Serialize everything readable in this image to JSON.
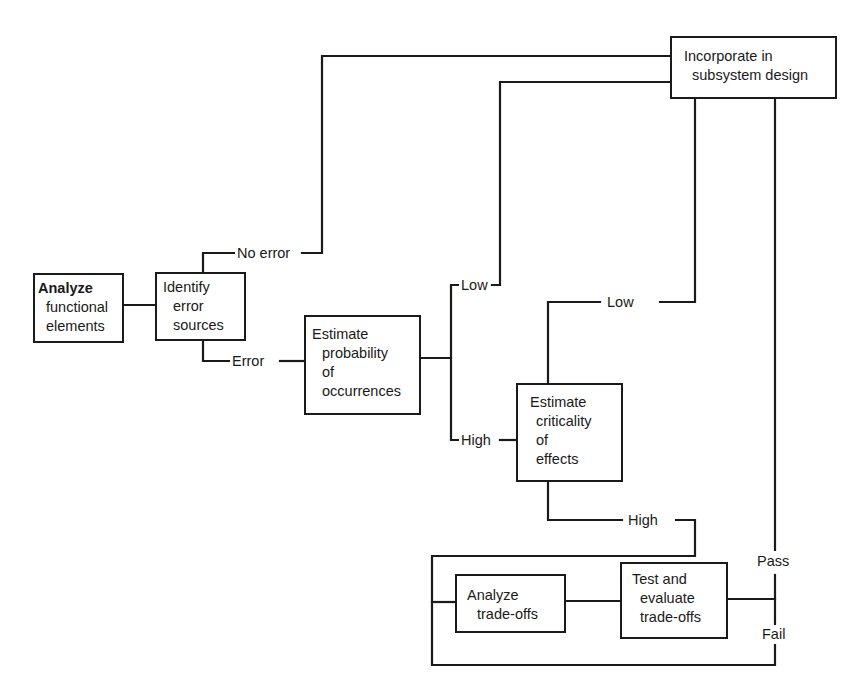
{
  "diagram": {
    "type": "flowchart",
    "nodes": {
      "analyze_functional": {
        "lines": [
          "Analyze",
          "functional",
          "elements"
        ]
      },
      "identify_errors": {
        "lines": [
          "Identify",
          "error",
          "sources"
        ]
      },
      "estimate_probability": {
        "lines": [
          "Estimate",
          "probability",
          "of",
          "occurrences"
        ]
      },
      "estimate_criticality": {
        "lines": [
          "Estimate",
          "criticality",
          "of",
          "effects"
        ]
      },
      "incorporate": {
        "lines": [
          "Incorporate in",
          "subsystem design"
        ]
      },
      "analyze_tradeoffs": {
        "lines": [
          "Analyze",
          "trade-offs"
        ]
      },
      "test_tradeoffs": {
        "lines": [
          "Test and",
          "evaluate",
          "trade-offs"
        ]
      }
    },
    "edge_labels": {
      "no_error": "No error",
      "error": "Error",
      "prob_low": "Low",
      "prob_high": "High",
      "crit_low": "Low",
      "crit_high": "High",
      "pass": "Pass",
      "fail": "Fail"
    },
    "edges": [
      {
        "from": "analyze_functional",
        "to": "identify_errors"
      },
      {
        "from": "identify_errors",
        "to": "incorporate",
        "label": "No error"
      },
      {
        "from": "identify_errors",
        "to": "estimate_probability",
        "label": "Error"
      },
      {
        "from": "estimate_probability",
        "to": "incorporate",
        "label": "Low"
      },
      {
        "from": "estimate_probability",
        "to": "estimate_criticality",
        "label": "High"
      },
      {
        "from": "estimate_criticality",
        "to": "incorporate",
        "label": "Low"
      },
      {
        "from": "estimate_criticality",
        "to": "analyze_tradeoffs",
        "label": "High"
      },
      {
        "from": "analyze_tradeoffs",
        "to": "test_tradeoffs"
      },
      {
        "from": "test_tradeoffs",
        "to": "incorporate",
        "label": "Pass"
      },
      {
        "from": "test_tradeoffs",
        "to": "analyze_tradeoffs",
        "label": "Fail"
      }
    ],
    "colors": {
      "stroke": "#1a1a1a",
      "background": "#ffffff"
    }
  }
}
